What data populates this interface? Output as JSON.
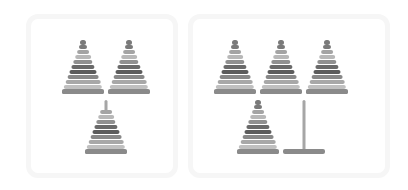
{
  "figure": {
    "panels": [
      {
        "id": "left",
        "towers": [
          {
            "type": "full-with-knob",
            "rings": 9
          },
          {
            "type": "full-with-knob",
            "rings": 9
          },
          {
            "type": "full-with-peg-top",
            "rings": 8
          }
        ]
      },
      {
        "id": "right",
        "towers": [
          {
            "type": "full-with-knob",
            "rings": 9
          },
          {
            "type": "full-with-knob",
            "rings": 9
          },
          {
            "type": "full-with-knob",
            "rings": 9
          },
          {
            "type": "full-with-knob",
            "rings": 9
          },
          {
            "type": "empty-peg",
            "rings": 0
          }
        ]
      }
    ],
    "colors": {
      "ring_shades": [
        "#7a7a7a",
        "#a4a4a4",
        "#b8b8b8",
        "#909090",
        "#6a6a6a",
        "#5c5c5c",
        "#888888",
        "#a8a8a8",
        "#c0c0c0",
        "#7c7c7c"
      ],
      "peg": "#a6a6a6",
      "base": "#8a8a8a",
      "panel_border": "#f6f6f6"
    }
  }
}
